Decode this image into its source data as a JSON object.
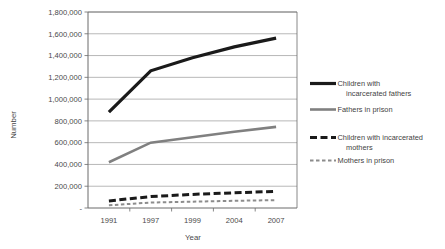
{
  "chart_data": {
    "type": "line",
    "title": "",
    "xlabel": "Year",
    "ylabel": "Number",
    "categories": [
      "1991",
      "1997",
      "1999",
      "2004",
      "2007"
    ],
    "ylim": [
      0,
      1800000
    ],
    "ytick_step": 200000,
    "yticks": [
      "-",
      "200,000",
      "400,000",
      "600,000",
      "800,000",
      "1,000,000",
      "1,200,000",
      "1,400,000",
      "1,600,000",
      "1,800,000"
    ],
    "ytick_values": [
      0,
      200000,
      400000,
      600000,
      800000,
      1000000,
      1200000,
      1400000,
      1600000,
      1800000
    ],
    "grid": true,
    "legend_position": "right",
    "series": [
      {
        "name": "Children with incarcerated fathers",
        "label_line1": "Children with",
        "label_line2": "incarcerated fathers",
        "values": [
          880000,
          1260000,
          1380000,
          1480000,
          1560000
        ],
        "color": "#1a1a1a",
        "width": 3.2,
        "dash": "none"
      },
      {
        "name": "Fathers in prison",
        "label_line1": "Fathers in prison",
        "label_line2": "",
        "values": [
          420000,
          600000,
          650000,
          700000,
          745000
        ],
        "color": "#808080",
        "width": 2.6,
        "dash": "none"
      },
      {
        "name": "Children with incarcerated mothers",
        "label_line1": "Children with incarcerated",
        "label_line2": "mothers",
        "values": [
          65000,
          105000,
          125000,
          140000,
          152000
        ],
        "color": "#1a1a1a",
        "width": 3.0,
        "dash": "7,3.5"
      },
      {
        "name": "Mothers in prison",
        "label_line1": "Mothers in prison",
        "label_line2": "",
        "values": [
          25000,
          50000,
          58000,
          66000,
          72000
        ],
        "color": "#8c8c8c",
        "width": 2.0,
        "dash": "3.5,2.5"
      }
    ]
  },
  "legend": {
    "entries": [
      {
        "line1": "Children with",
        "line2": "incarcerated fathers"
      },
      {
        "line1": "Fathers in prison",
        "line2": ""
      },
      {
        "line1": "Children with incarcerated",
        "line2": "mothers"
      },
      {
        "line1": "Mothers in prison",
        "line2": ""
      }
    ]
  },
  "axes": {
    "y_title": "Number",
    "x_title": "Year"
  }
}
